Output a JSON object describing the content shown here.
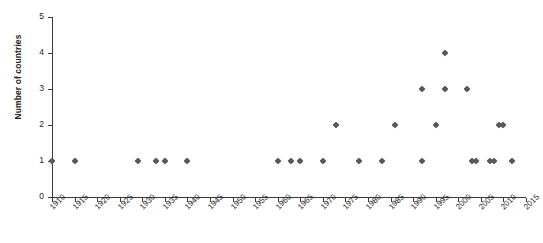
{
  "chart_data": {
    "type": "scatter",
    "title": "",
    "xlabel": "",
    "ylabel": "Number of countries",
    "xlim": [
      1910,
      2015
    ],
    "ylim": [
      0,
      5
    ],
    "grid": false,
    "legend": "none",
    "marker": "diamond",
    "marker_color": "#58595b",
    "axis_color": "#3a3a3a",
    "xticks": [
      1910,
      1915,
      1920,
      1925,
      1930,
      1935,
      1940,
      1945,
      1950,
      1955,
      1960,
      1965,
      1970,
      1975,
      1980,
      1985,
      1990,
      1995,
      2000,
      2005,
      2010,
      2015
    ],
    "xtick_labels": [
      "1910",
      "1915",
      "1920",
      "1925",
      "1930",
      "1935",
      "1940",
      "1945",
      "1950",
      "1955",
      "1960",
      "1965",
      "1970",
      "1975",
      "1980",
      "1985",
      "1990",
      "1995",
      "2000",
      "2005",
      "2010",
      "2015"
    ],
    "yticks": [
      0,
      1,
      2,
      3,
      4,
      5
    ],
    "ytick_labels": [
      "0",
      "1",
      "2",
      "3",
      "4",
      "5"
    ],
    "points": [
      {
        "x": 1910,
        "y": 1
      },
      {
        "x": 1915,
        "y": 1
      },
      {
        "x": 1929,
        "y": 1
      },
      {
        "x": 1933,
        "y": 1
      },
      {
        "x": 1935,
        "y": 1
      },
      {
        "x": 1940,
        "y": 1
      },
      {
        "x": 1960,
        "y": 1
      },
      {
        "x": 1963,
        "y": 1
      },
      {
        "x": 1965,
        "y": 1
      },
      {
        "x": 1970,
        "y": 1
      },
      {
        "x": 1973,
        "y": 2
      },
      {
        "x": 1978,
        "y": 1
      },
      {
        "x": 1983,
        "y": 1
      },
      {
        "x": 1986,
        "y": 2
      },
      {
        "x": 1992,
        "y": 1
      },
      {
        "x": 1992,
        "y": 3
      },
      {
        "x": 1995,
        "y": 2
      },
      {
        "x": 1997,
        "y": 3
      },
      {
        "x": 1997,
        "y": 4
      },
      {
        "x": 2002,
        "y": 3
      },
      {
        "x": 2003,
        "y": 1
      },
      {
        "x": 2004,
        "y": 1
      },
      {
        "x": 2007,
        "y": 1
      },
      {
        "x": 2008,
        "y": 1
      },
      {
        "x": 2009,
        "y": 2
      },
      {
        "x": 2010,
        "y": 2
      },
      {
        "x": 2012,
        "y": 1
      }
    ]
  }
}
